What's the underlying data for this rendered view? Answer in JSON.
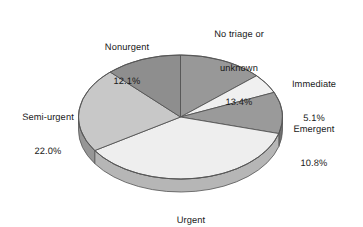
{
  "chart_data": {
    "type": "pie",
    "title": "",
    "subtitle": "",
    "xlabel": "",
    "ylabel": "",
    "grid": false,
    "legend_position": "none",
    "label_format": "name + percent",
    "units": "percent",
    "three_d": true,
    "start_angle_deg": 0,
    "direction": "clockwise",
    "categories": [
      "No triage or unknown",
      "Immediate",
      "Emergent",
      "Urgent",
      "Semi-urgent",
      "Nonurgent"
    ],
    "values": [
      13.4,
      5.1,
      10.8,
      36.6,
      22.0,
      12.1
    ],
    "slices": [
      {
        "name": "No triage or unknown",
        "label_line1": "No triage or",
        "label_line2": "unknown",
        "value": 13.4,
        "value_label": "13.4%",
        "color": "#989898",
        "side_color": "#6f6f6f",
        "start_deg": 0.0,
        "end_deg": 48.24
      },
      {
        "name": "Immediate",
        "label_line1": "Immediate",
        "label_line2": "",
        "value": 5.1,
        "value_label": "5.1%",
        "color": "#f0f0f0",
        "side_color": "#b9b9b9",
        "start_deg": 48.24,
        "end_deg": 66.6
      },
      {
        "name": "Emergent",
        "label_line1": "Emergent",
        "label_line2": "",
        "value": 10.8,
        "value_label": "10.8%",
        "color": "#9a9a9a",
        "side_color": "#717171",
        "start_deg": 66.6,
        "end_deg": 105.48
      },
      {
        "name": "Urgent",
        "label_line1": "Urgent",
        "label_line2": "",
        "value": 36.6,
        "value_label": "36.6%",
        "color": "#eeeeee",
        "side_color": "#b6b6b6",
        "start_deg": 105.48,
        "end_deg": 237.24
      },
      {
        "name": "Semi-urgent",
        "label_line1": "Semi-urgent",
        "label_line2": "",
        "value": 22.0,
        "value_label": "22.0%",
        "color": "#c8c8c8",
        "side_color": "#969696",
        "start_deg": 237.24,
        "end_deg": 316.44
      },
      {
        "name": "Nonurgent",
        "label_line1": "Nonurgent",
        "label_line2": "",
        "value": 12.1,
        "value_label": "12.1%",
        "color": "#8e8e8e",
        "side_color": "#6a6a6a",
        "start_deg": 316.44,
        "end_deg": 360.0
      }
    ],
    "total": 100.0,
    "background_color": "#ffffff",
    "outline_color": "#555555",
    "text_color": "#1a1a1a"
  }
}
